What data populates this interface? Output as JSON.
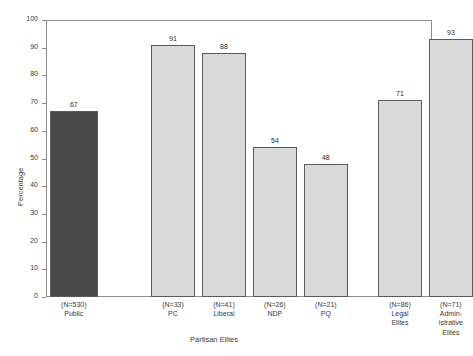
{
  "figure": {
    "clipped_title": "..........",
    "background": "#ffffff",
    "frame_color": "#8e8e8e"
  },
  "chart_data": {
    "type": "bar",
    "title": "",
    "xlabel": "Partisan Elites",
    "ylabel": "Percentage",
    "ylim": [
      0,
      100
    ],
    "ytick_step": 10,
    "grid": false,
    "legend": "none",
    "categories": [
      "Public",
      "PC",
      "Liberal",
      "NDP",
      "PQ",
      "Legal Elites",
      "Administrative Elites"
    ],
    "values": [
      67,
      91,
      88,
      54,
      48,
      71,
      93
    ],
    "sample_sizes": [
      "(N=530)",
      "(N=33)",
      "(N=41)",
      "(N=26)",
      "(N=21)",
      "(N=86)",
      "(N=71)"
    ],
    "ytick_labels": [
      "0",
      "10",
      "20",
      "30",
      "40",
      "50",
      "60",
      "70",
      "80",
      "90",
      "100"
    ],
    "bar_fill_solid": "#d9d9d9",
    "bar_fill_hatch": "#4a4a4a",
    "bar_edge": "#5a5a5a",
    "bars": [
      {
        "label": "Public",
        "value": 67,
        "value_text": "67",
        "n_text": "(N=530)",
        "group_lines": [
          "Public"
        ],
        "style": "hatch",
        "left_pct": 1.0,
        "width_pct": 12.4
      },
      {
        "label": "PC",
        "value": 91,
        "value_text": "91",
        "n_text": "(N=33)",
        "group_lines": [
          "PC"
        ],
        "style": "solid",
        "left_pct": 27.2,
        "width_pct": 11.4
      },
      {
        "label": "Liberal",
        "value": 88,
        "value_text": "88",
        "n_text": "(N=41)",
        "group_lines": [
          "Liberal"
        ],
        "style": "solid",
        "left_pct": 40.4,
        "width_pct": 11.4
      },
      {
        "label": "NDP",
        "value": 54,
        "value_text": "54",
        "n_text": "(N=26)",
        "group_lines": [
          "NDP"
        ],
        "style": "solid",
        "left_pct": 53.6,
        "width_pct": 11.4
      },
      {
        "label": "PQ",
        "value": 48,
        "value_text": "48",
        "n_text": "(N=21)",
        "group_lines": [
          "PQ"
        ],
        "style": "solid",
        "left_pct": 66.8,
        "width_pct": 11.4
      },
      {
        "label": "Legal Elites",
        "value": 71,
        "value_text": "71",
        "n_text": "(N=86)",
        "group_lines": [
          "Legal",
          "Elites"
        ],
        "style": "solid",
        "left_pct": 86.0,
        "width_pct": 11.4
      },
      {
        "label": "Administrative Elites",
        "value": 93,
        "value_text": "93",
        "n_text": "(N=71)",
        "group_lines": [
          "Admin-",
          "istrative",
          "Elites"
        ],
        "style": "solid",
        "left_pct": 99.2,
        "width_pct": 11.4
      }
    ]
  }
}
